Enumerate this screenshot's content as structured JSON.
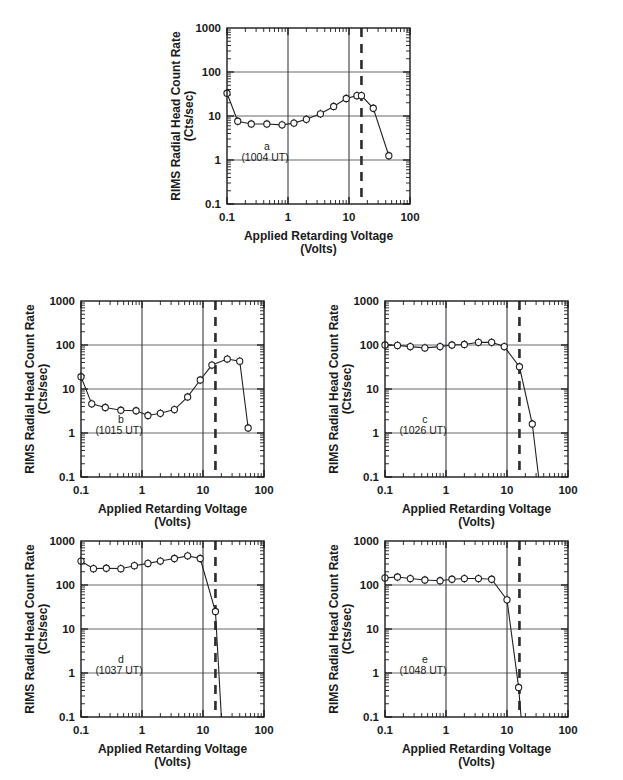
{
  "figure": {
    "axis": {
      "xlabel_line1": "Applied Retarding Voltage",
      "xlabel_line2": "(Volts)",
      "ylabel_line1": "RIMS Radial Head Count Rate",
      "ylabel_line2": "(Cts/sec)",
      "xticklabels": [
        "0.1",
        "1",
        "10",
        "100"
      ],
      "yticklabels": [
        "1000",
        "100",
        "10",
        "1",
        "0.1"
      ],
      "xlim": [
        0.1,
        100
      ],
      "ylim": [
        0.1,
        1000
      ],
      "xscale": "log",
      "yscale": "log",
      "grid": "horizontal-decades-and-vertical-decades"
    },
    "panels": [
      {
        "id": "a",
        "tag": "a",
        "time": "(1004 UT)",
        "cutoff_voltage": 16
      },
      {
        "id": "b",
        "tag": "b",
        "time": "(1015 UT)",
        "cutoff_voltage": 16
      },
      {
        "id": "c",
        "tag": "c",
        "time": "(1026 UT)",
        "cutoff_voltage": 16
      },
      {
        "id": "d",
        "tag": "d",
        "time": "(1037 UT)",
        "cutoff_voltage": 16
      },
      {
        "id": "e",
        "tag": "e",
        "time": "(1048 UT)",
        "cutoff_voltage": 16
      }
    ]
  },
  "chart_data": [
    {
      "type": "line",
      "id": "a",
      "title": "a (1004 UT)",
      "xlabel": "Applied Retarding Voltage (Volts)",
      "ylabel": "RIMS Radial Head Count Rate (Cts/sec)",
      "xscale": "log",
      "yscale": "log",
      "xlim": [
        0.1,
        100
      ],
      "ylim": [
        0.1,
        1000
      ],
      "xticks": [
        0.1,
        1,
        10,
        100
      ],
      "yticks": [
        0.1,
        1,
        10,
        100,
        1000
      ],
      "annotations": [
        {
          "text": "a",
          "x": 0.45,
          "y": 1.7
        },
        {
          "text": "(1004 UT)",
          "x": 0.42,
          "y": 0.95
        }
      ],
      "reference_lines": [
        {
          "kind": "dashed-vertical",
          "x": 16
        },
        {
          "kind": "solid-vertical",
          "x": 10
        },
        {
          "kind": "solid-vertical",
          "x": 1
        }
      ],
      "x": [
        0.1,
        0.15,
        0.25,
        0.45,
        0.8,
        1.25,
        2.0,
        3.4,
        5.6,
        9.0,
        13.5,
        16.0,
        25.0,
        45.0
      ],
      "y": [
        33,
        7.6,
        6.6,
        6.6,
        6.3,
        6.9,
        8.4,
        11.2,
        16.5,
        25.0,
        29.0,
        29.0,
        15.0,
        1.25
      ]
    },
    {
      "type": "line",
      "id": "b",
      "title": "b (1015 UT)",
      "xlabel": "Applied Retarding Voltage (Volts)",
      "ylabel": "RIMS Radial Head Count Rate (Cts/sec)",
      "xscale": "log",
      "yscale": "log",
      "xlim": [
        0.1,
        100
      ],
      "ylim": [
        0.1,
        1000
      ],
      "xticks": [
        0.1,
        1,
        10,
        100
      ],
      "yticks": [
        0.1,
        1,
        10,
        100,
        1000
      ],
      "annotations": [
        {
          "text": "b",
          "x": 0.45,
          "y": 1.7
        },
        {
          "text": "(1015 UT)",
          "x": 0.42,
          "y": 0.95
        }
      ],
      "reference_lines": [
        {
          "kind": "dashed-vertical",
          "x": 16
        },
        {
          "kind": "solid-vertical",
          "x": 10
        },
        {
          "kind": "solid-vertical",
          "x": 1
        }
      ],
      "x": [
        0.1,
        0.15,
        0.25,
        0.45,
        0.8,
        1.25,
        2.0,
        3.4,
        5.6,
        9.0,
        14.0,
        25.0,
        40.0,
        55.0
      ],
      "y": [
        19,
        4.6,
        3.8,
        3.3,
        3.2,
        2.5,
        2.8,
        3.4,
        6.6,
        16.0,
        35.0,
        48.0,
        43.0,
        1.3
      ]
    },
    {
      "type": "line",
      "id": "c",
      "title": "c (1026 UT)",
      "xlabel": "Applied Retarding Voltage (Volts)",
      "ylabel": "RIMS Radial Head Count Rate (Cts/sec)",
      "xscale": "log",
      "yscale": "log",
      "xlim": [
        0.1,
        100
      ],
      "ylim": [
        0.1,
        1000
      ],
      "xticks": [
        0.1,
        1,
        10,
        100
      ],
      "yticks": [
        0.1,
        1,
        10,
        100,
        1000
      ],
      "annotations": [
        {
          "text": "c",
          "x": 0.45,
          "y": 1.7
        },
        {
          "text": "(1026 UT)",
          "x": 0.42,
          "y": 0.95
        }
      ],
      "reference_lines": [
        {
          "kind": "dashed-vertical",
          "x": 16
        },
        {
          "kind": "solid-vertical",
          "x": 10
        },
        {
          "kind": "solid-vertical",
          "x": 1
        }
      ],
      "x": [
        0.1,
        0.16,
        0.26,
        0.45,
        0.8,
        1.25,
        2.0,
        3.4,
        5.6,
        9.0,
        16.0,
        26.0,
        33.0
      ],
      "y": [
        100,
        98,
        92,
        86,
        92,
        100,
        103,
        115,
        115,
        92,
        32,
        1.6,
        0.1
      ]
    },
    {
      "type": "line",
      "id": "d",
      "title": "d (1037 UT)",
      "xlabel": "Applied Retarding Voltage (Volts)",
      "ylabel": "RIMS Radial Head Count Rate (Cts/sec)",
      "xscale": "log",
      "yscale": "log",
      "xlim": [
        0.1,
        100
      ],
      "ylim": [
        0.1,
        1000
      ],
      "xticks": [
        0.1,
        1,
        10,
        100
      ],
      "yticks": [
        0.1,
        1,
        10,
        100,
        1000
      ],
      "annotations": [
        {
          "text": "d",
          "x": 0.45,
          "y": 1.7
        },
        {
          "text": "(1037 UT)",
          "x": 0.42,
          "y": 0.95
        }
      ],
      "reference_lines": [
        {
          "kind": "dashed-vertical",
          "x": 16
        },
        {
          "kind": "solid-vertical",
          "x": 10
        },
        {
          "kind": "solid-vertical",
          "x": 1
        }
      ],
      "x": [
        0.1,
        0.16,
        0.26,
        0.45,
        0.75,
        1.25,
        2.0,
        3.4,
        5.6,
        9.0,
        16.0,
        20.0
      ],
      "y": [
        350,
        235,
        240,
        235,
        275,
        310,
        350,
        400,
        460,
        400,
        25,
        0.1
      ]
    },
    {
      "type": "line",
      "id": "e",
      "title": "e (1048 UT)",
      "xlabel": "Applied Retarding Voltage (Volts)",
      "ylabel": "RIMS Radial Head Count Rate (Cts/sec)",
      "xscale": "log",
      "yscale": "log",
      "xlim": [
        0.1,
        100
      ],
      "ylim": [
        0.1,
        1000
      ],
      "xticks": [
        0.1,
        1,
        10,
        100
      ],
      "yticks": [
        0.1,
        1,
        10,
        100,
        1000
      ],
      "annotations": [
        {
          "text": "e",
          "x": 0.45,
          "y": 1.7
        },
        {
          "text": "(1048 UT)",
          "x": 0.42,
          "y": 0.95
        }
      ],
      "reference_lines": [
        {
          "kind": "dashed-vertical",
          "x": 16
        },
        {
          "kind": "solid-vertical",
          "x": 10
        },
        {
          "kind": "solid-vertical",
          "x": 1
        }
      ],
      "x": [
        0.1,
        0.16,
        0.26,
        0.45,
        0.8,
        1.25,
        2.0,
        3.4,
        5.6,
        10.0,
        15.5,
        17.0
      ],
      "y": [
        145,
        152,
        140,
        130,
        125,
        135,
        140,
        140,
        135,
        46,
        0.47,
        0.1
      ]
    }
  ]
}
